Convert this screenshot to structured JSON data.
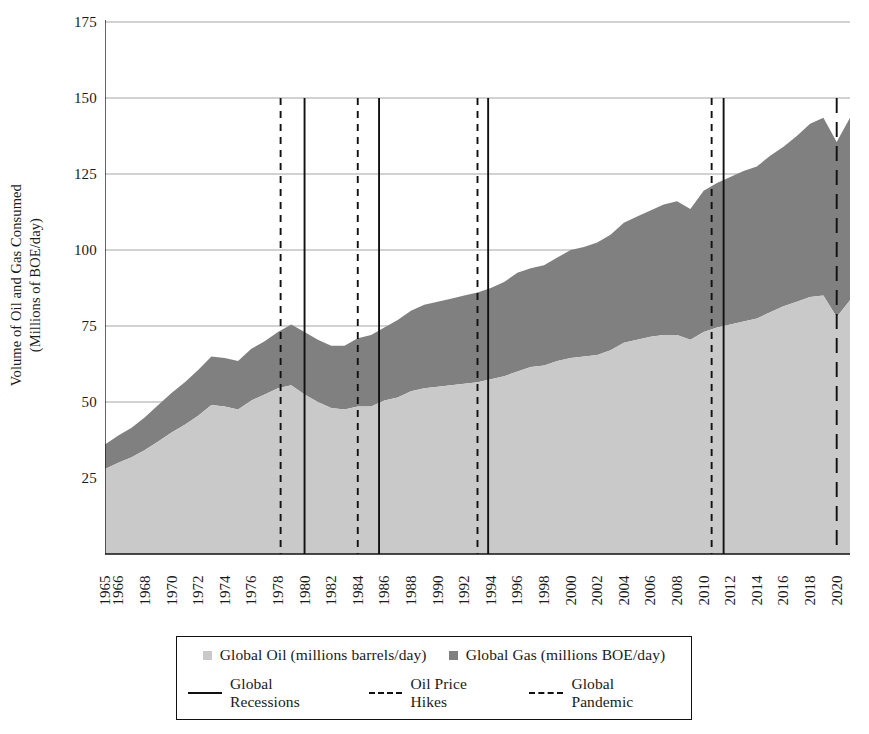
{
  "chart_data": {
    "type": "area",
    "title": "",
    "xlabel": "",
    "ylabel": "Volume of Oil and Gas Consumed\n(Millions of BOE/day)",
    "ylabel_line1": "Volume of Oil and Gas Consumed",
    "ylabel_line2": "(Millions of BOE/day)",
    "ylim": [
      0,
      175
    ],
    "yticks": [
      175,
      150,
      125,
      100,
      75,
      50,
      25,
      0
    ],
    "ytick_labels": [
      "175",
      "150",
      "125",
      "100",
      "75",
      "50",
      "25",
      ""
    ],
    "grid": "horizontal",
    "stacked": true,
    "xlim": [
      1965,
      2021
    ],
    "x": [
      1965,
      1966,
      1967,
      1968,
      1969,
      1970,
      1971,
      1972,
      1973,
      1974,
      1975,
      1976,
      1977,
      1978,
      1979,
      1980,
      1981,
      1982,
      1983,
      1984,
      1985,
      1986,
      1987,
      1988,
      1989,
      1990,
      1991,
      1992,
      1993,
      1994,
      1995,
      1996,
      1997,
      1998,
      1999,
      2000,
      2001,
      2002,
      2003,
      2004,
      2005,
      2006,
      2007,
      2008,
      2009,
      2010,
      2011,
      2012,
      2013,
      2014,
      2015,
      2016,
      2017,
      2018,
      2019,
      2020,
      2021
    ],
    "xtick_labels": [
      "1965",
      "1966",
      "1968",
      "1970",
      "1972",
      "1974",
      "1976",
      "1978",
      "1980",
      "1982",
      "1984",
      "1986",
      "1988",
      "1990",
      "1992",
      "1994",
      "1996",
      "1998",
      "2000",
      "2002",
      "2004",
      "2006",
      "2008",
      "2010",
      "2012",
      "2014",
      "2016",
      "2018",
      "2020"
    ],
    "xtick_values": [
      1965,
      1966,
      1968,
      1970,
      1972,
      1974,
      1976,
      1978,
      1980,
      1982,
      1984,
      1986,
      1988,
      1990,
      1992,
      1994,
      1996,
      1998,
      2000,
      2002,
      2004,
      2006,
      2008,
      2010,
      2012,
      2014,
      2016,
      2018,
      2020
    ],
    "legend_position": "below-center",
    "series": [
      {
        "name": "Global Oil (millions barrels/day)",
        "color": "#c9c9c9",
        "values": [
          28.0,
          30.0,
          31.8,
          34.2,
          37.0,
          40.0,
          42.5,
          45.5,
          49.0,
          48.5,
          47.5,
          50.5,
          52.5,
          54.5,
          55.5,
          52.5,
          50.0,
          48.0,
          47.5,
          48.5,
          48.5,
          50.5,
          51.5,
          53.5,
          54.5,
          55.0,
          55.5,
          56.0,
          56.5,
          57.5,
          58.5,
          60.0,
          61.5,
          62.0,
          63.5,
          64.5,
          65.0,
          65.5,
          67.0,
          69.5,
          70.5,
          71.5,
          72.0,
          72.0,
          70.5,
          73.0,
          74.5,
          75.5,
          76.5,
          77.5,
          79.5,
          81.5,
          83.0,
          84.5,
          85.0,
          78.0,
          83.5
        ]
      },
      {
        "name": "Global Gas (millions BOE/day)",
        "color": "#808080",
        "values": [
          8.0,
          9.0,
          9.7,
          10.8,
          12.0,
          13.0,
          14.0,
          15.0,
          16.0,
          16.0,
          16.0,
          17.0,
          17.5,
          18.5,
          20.0,
          20.5,
          20.5,
          20.5,
          21.0,
          22.5,
          23.5,
          24.0,
          25.5,
          26.5,
          27.5,
          28.0,
          28.5,
          29.0,
          29.5,
          30.0,
          31.0,
          32.5,
          32.5,
          33.0,
          34.0,
          35.5,
          36.0,
          37.0,
          38.0,
          39.5,
          40.5,
          41.5,
          43.0,
          44.0,
          43.0,
          46.5,
          47.5,
          48.5,
          49.5,
          50.0,
          51.5,
          52.5,
          54.5,
          57.0,
          58.5,
          57.5,
          60.0
        ]
      }
    ],
    "annotations": {
      "recession_label": "Global Recessions",
      "oil_hike_label": "Oil Price Hikes",
      "pandemic_label": "Global Pandemic",
      "recession_years": [
        1980,
        1985.6,
        1993.8,
        2011.5
      ],
      "oil_hike_years": [
        1978.2,
        1984.0,
        1993.0,
        2010.6
      ],
      "pandemic_years": [
        2020.0
      ],
      "recession_style": "solid",
      "oil_hike_style": "dashed",
      "pandemic_style": "long-dashed",
      "line_color": "#111111"
    }
  },
  "legend": {
    "items_markers": [
      {
        "label": "Global Oil (millions barrels/day)",
        "marker": "square",
        "color": "#c9c9c9"
      },
      {
        "label": "Global Gas (millions BOE/day)",
        "marker": "square",
        "color": "#808080"
      }
    ],
    "items_lines": [
      {
        "label": "Global Recessions",
        "marker": "solid-line"
      },
      {
        "label": "Oil Price Hikes",
        "marker": "dashed-line"
      },
      {
        "label": "Global Pandemic",
        "marker": "long-dashed-line"
      }
    ]
  }
}
